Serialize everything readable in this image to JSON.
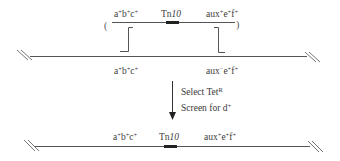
{
  "diagram": {
    "type": "genetic-transduction-schematic",
    "donor_fragment": {
      "open_paren": "(",
      "close_paren": ")",
      "left_label": {
        "base": "a",
        "s1": "+",
        "b": "b",
        "s2": "+",
        "c": "c",
        "s3": "+"
      },
      "insert_label": {
        "tn": "Tn",
        "num": "10"
      },
      "right_label": {
        "base": "aux",
        "s1": "+",
        "e": "e",
        "s2": "+",
        "f": "f",
        "s3": "+"
      }
    },
    "recipient_chromosome": {
      "left_label": {
        "base": "a",
        "s1": "+",
        "b": "b",
        "s2": "+",
        "c": "c",
        "s3": "+"
      },
      "right_label": {
        "base": "aux",
        "s1": "−",
        "e": "e",
        "s2": "+",
        "f": "f",
        "s3": "+"
      }
    },
    "step": {
      "line1_text": "Select Tet",
      "line1_sup": "R",
      "line2_text": "Screen for d",
      "line2_sup": "+"
    },
    "result_chromosome": {
      "left_label": {
        "base": "a",
        "s1": "+",
        "b": "b",
        "s2": "+",
        "c": "c",
        "s3": "+"
      },
      "insert_label": {
        "tn": "Tn",
        "num": "10"
      },
      "right_label": {
        "base": "aux",
        "s1": "+",
        "e": "e",
        "s2": "+",
        "f": "f",
        "s3": "+"
      }
    },
    "colors": {
      "line": "#555555",
      "insert": "#222222",
      "text": "#3a3a3a"
    }
  }
}
